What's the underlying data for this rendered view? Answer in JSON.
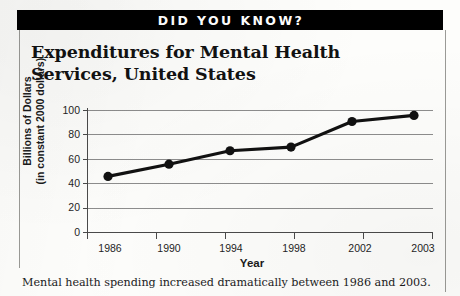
{
  "banner": {
    "label": "DID YOU KNOW?"
  },
  "title": "Expenditures for Mental Health Services, United States",
  "caption": "Mental health spending increased dramatically between 1986 and 2003.",
  "colors": {
    "banner_background": "#000000",
    "banner_text": "#ffffff",
    "page_background": "#fdfdfb",
    "line": "#111111",
    "marker": "#111111",
    "gridline": "#8d8d8d",
    "axis": "#4a4a4a",
    "text": "#1b1b1b"
  },
  "chart_data": {
    "type": "line",
    "title": "Expenditures for Mental Health Services, United States",
    "xlabel": "Year",
    "ylabel": "Billions of Dollars\n(in constant 2000 dollars)",
    "categories": [
      "1986",
      "1990",
      "1994",
      "1998",
      "2002",
      "2003"
    ],
    "values": [
      46,
      56,
      67,
      70,
      91,
      96
    ],
    "series": [
      {
        "name": "Mental health expenditures",
        "values": [
          46,
          56,
          67,
          70,
          91,
          96
        ]
      }
    ],
    "ylim": [
      0,
      100
    ],
    "yticks": [
      0,
      20,
      40,
      60,
      80,
      100
    ],
    "xticks": [
      "1986",
      "1990",
      "1994",
      "1998",
      "2002",
      "2003"
    ],
    "grid": "horizontal",
    "legend": "none",
    "markers": "filled-circle",
    "annotations": []
  }
}
